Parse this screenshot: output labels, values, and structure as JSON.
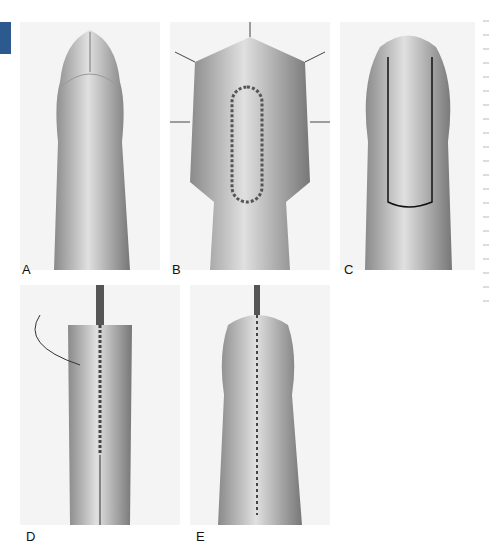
{
  "figure": {
    "panels": [
      {
        "id": "A",
        "label": "A",
        "description": "Uncircumcised penis, dorsal view"
      },
      {
        "id": "B",
        "label": "B",
        "description": "Dorsal incision closed with interrupted sutures, stay sutures in place"
      },
      {
        "id": "C",
        "label": "C",
        "description": "Outlined rectangular skin flap"
      },
      {
        "id": "D",
        "label": "D",
        "description": "Running suture closure with urethral catheter"
      },
      {
        "id": "E",
        "label": "E",
        "description": "Completed midline suture line"
      }
    ],
    "accent_tab_color": "#2c5a8e"
  }
}
